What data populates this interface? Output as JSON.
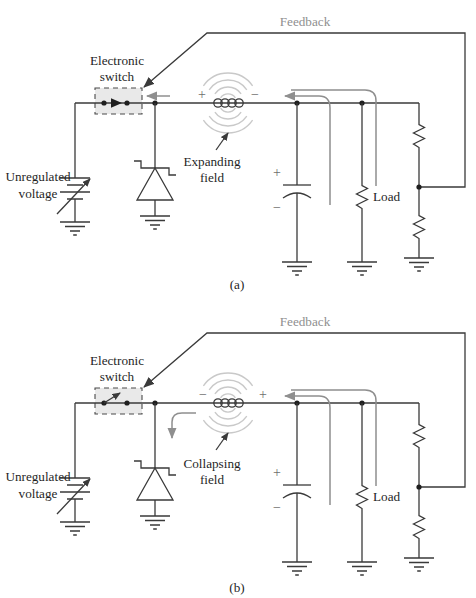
{
  "figure_type": "switching-regulator-circuit-diagram",
  "panels": [
    {
      "caption": "(a)",
      "feedback_label": "Feedback",
      "switch_label_1": "Electronic",
      "switch_label_2": "switch",
      "switch_state": "closed",
      "source_label_1": "Unregulated",
      "source_label_2": "voltage",
      "inductor_polarity_left": "+",
      "inductor_polarity_right": "−",
      "field_label_1": "Expanding",
      "field_label_2": "field",
      "capacitor_polarity_top": "+",
      "capacitor_polarity_bottom": "−",
      "load_label": "Load"
    },
    {
      "caption": "(b)",
      "feedback_label": "Feedback",
      "switch_label_1": "Electronic",
      "switch_label_2": "switch",
      "switch_state": "open",
      "source_label_1": "Unregulated",
      "source_label_2": "voltage",
      "inductor_polarity_left": "−",
      "inductor_polarity_right": "+",
      "field_label_1": "Collapsing",
      "field_label_2": "field",
      "capacitor_polarity_top": "+",
      "capacitor_polarity_bottom": "−",
      "load_label": "Load"
    }
  ],
  "colors": {
    "wire": "#3a3a3a",
    "annotation_gray": "#8f8f8f",
    "field_arc_gray": "#c9c9c9",
    "switch_box_fill": "#e9e9e9",
    "text": "#1f1f1f",
    "feedback_text": "#8f8f8f"
  }
}
